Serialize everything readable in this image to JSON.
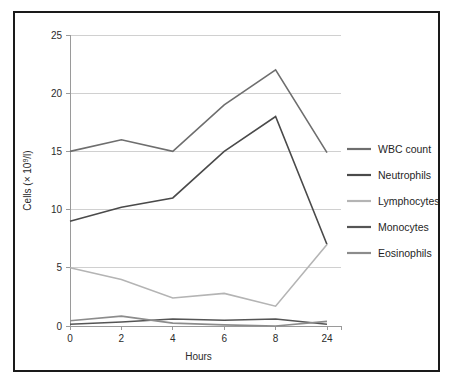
{
  "chart_data": {
    "type": "line",
    "title": "",
    "xlabel": "Hours",
    "ylabel": "Cells (× 10⁹/l)",
    "ylabel_parts": {
      "prefix": "Cells (× 10",
      "exponent": "9",
      "suffix": "/l)"
    },
    "categories": [
      "0",
      "2",
      "4",
      "6",
      "8",
      "24"
    ],
    "x_tick_labels": [
      "0",
      "2",
      "4",
      "6",
      "8",
      "24"
    ],
    "y_tick_labels": [
      "0",
      "5",
      "10",
      "15",
      "20",
      "25"
    ],
    "y_ticks": [
      0,
      5,
      10,
      15,
      20,
      25
    ],
    "ylim": [
      0,
      25
    ],
    "grid": "horizontal",
    "legend_position": "right",
    "series": [
      {
        "name": "WBC count",
        "color": "#6e6e6e",
        "values": [
          15.0,
          16.0,
          15.0,
          19.0,
          22.0,
          14.9
        ]
      },
      {
        "name": "Neutrophils",
        "color": "#4a4a4a",
        "values": [
          9.0,
          10.2,
          11.0,
          15.0,
          18.0,
          7.0
        ]
      },
      {
        "name": "Lymphocytes",
        "color": "#b4b4b4",
        "values": [
          5.0,
          4.0,
          2.4,
          2.8,
          1.7,
          7.0
        ]
      },
      {
        "name": "Monocytes",
        "color": "#555555",
        "values": [
          0.15,
          0.35,
          0.6,
          0.5,
          0.6,
          0.15
        ]
      },
      {
        "name": "Eosinophils",
        "color": "#8c8c8c",
        "values": [
          0.45,
          0.85,
          0.25,
          0.1,
          0.0,
          0.4
        ]
      }
    ]
  },
  "legend": {
    "items": [
      {
        "label": "WBC count",
        "color": "#6e6e6e"
      },
      {
        "label": "Neutrophils",
        "color": "#4a4a4a"
      },
      {
        "label": "Lymphocytes",
        "color": "#b4b4b4"
      },
      {
        "label": "Monocytes",
        "color": "#555555"
      },
      {
        "label": "Eosinophils",
        "color": "#8c8c8c"
      }
    ]
  },
  "frame": {
    "border_color": "#1a1a1a",
    "background": "#ffffff"
  }
}
